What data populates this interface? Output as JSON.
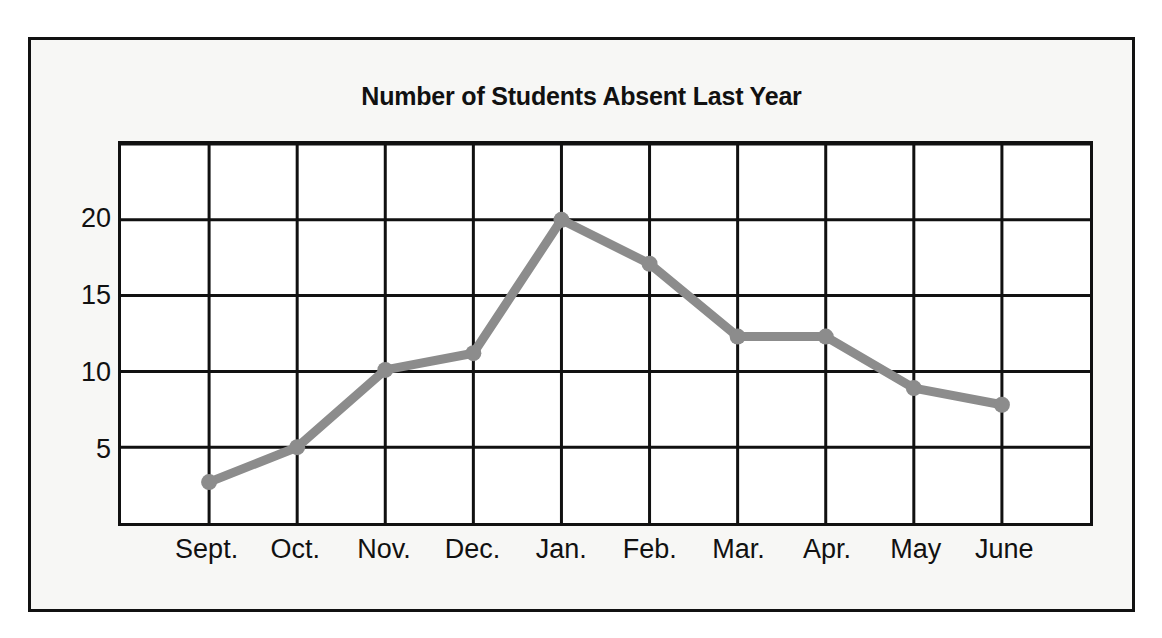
{
  "chart_data": {
    "type": "line",
    "title": "Number of Students Absent Last Year",
    "xlabel": "",
    "ylabel": "",
    "categories": [
      "Sept.",
      "Oct.",
      "Nov.",
      "Dec.",
      "Jan.",
      "Feb.",
      "Mar.",
      "Apr.",
      "May",
      "June"
    ],
    "values": [
      2.7,
      5.0,
      10.1,
      11.2,
      20.0,
      17.1,
      12.3,
      12.3,
      8.9,
      7.8
    ],
    "series": [
      {
        "name": "Students absent",
        "values": [
          2.7,
          5.0,
          10.1,
          11.2,
          20.0,
          17.1,
          12.3,
          12.3,
          8.9,
          7.8
        ]
      }
    ],
    "ylim": [
      0,
      25
    ],
    "ytick_labels": [
      "20",
      "15",
      "10",
      "5"
    ],
    "ytick_values": [
      20,
      15,
      10,
      5
    ],
    "gridline_values": [
      25,
      20,
      15,
      10,
      5
    ],
    "grid": true,
    "legend": "none",
    "line_color": "#8c8c8c",
    "marker_color": "#8c8c8c",
    "grid_color": "#111111",
    "frame_color": "#111111",
    "plot_background": "#ffffff",
    "figure_background": "#f7f7f5"
  }
}
